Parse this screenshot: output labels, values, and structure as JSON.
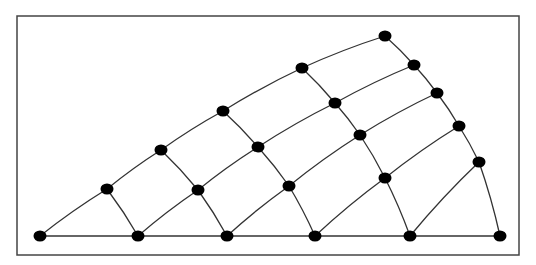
{
  "diagram": {
    "type": "triangular-mesh",
    "colors": {
      "background": "#ffffff",
      "frame": "#444444",
      "edge": "#333333",
      "node": "#000000"
    },
    "frame": {
      "x": 17,
      "y": 16,
      "width": 502,
      "height": 239
    },
    "nodes": [
      {
        "id": "b0",
        "x": 40,
        "y": 236
      },
      {
        "id": "b1",
        "x": 138,
        "y": 236
      },
      {
        "id": "b2",
        "x": 227,
        "y": 236
      },
      {
        "id": "b3",
        "x": 315,
        "y": 236
      },
      {
        "id": "b4",
        "x": 410,
        "y": 236
      },
      {
        "id": "b5",
        "x": 500,
        "y": 236
      },
      {
        "id": "r1a",
        "x": 107,
        "y": 189
      },
      {
        "id": "r1b",
        "x": 198,
        "y": 190
      },
      {
        "id": "r1c",
        "x": 289,
        "y": 186
      },
      {
        "id": "r1d",
        "x": 385,
        "y": 178
      },
      {
        "id": "r1e",
        "x": 479,
        "y": 162
      },
      {
        "id": "r2a",
        "x": 161,
        "y": 150
      },
      {
        "id": "r2b",
        "x": 258,
        "y": 147
      },
      {
        "id": "r2c",
        "x": 360,
        "y": 135
      },
      {
        "id": "r2d",
        "x": 459,
        "y": 126
      },
      {
        "id": "r3a",
        "x": 223,
        "y": 111
      },
      {
        "id": "r3b",
        "x": 335,
        "y": 103
      },
      {
        "id": "r3c",
        "x": 437,
        "y": 93
      },
      {
        "id": "r4a",
        "x": 302,
        "y": 68
      },
      {
        "id": "r4b",
        "x": 414,
        "y": 65
      },
      {
        "id": "t0",
        "x": 385,
        "y": 36
      }
    ],
    "edges": [
      [
        "b0",
        "b1"
      ],
      [
        "b1",
        "b2"
      ],
      [
        "b2",
        "b3"
      ],
      [
        "b3",
        "b4"
      ],
      [
        "b4",
        "b5"
      ],
      [
        "b0",
        "r1a"
      ],
      [
        "r1a",
        "r2a"
      ],
      [
        "r2a",
        "r3a"
      ],
      [
        "r3a",
        "r4a"
      ],
      [
        "r4a",
        "t0"
      ],
      [
        "b5",
        "r1e"
      ],
      [
        "r1e",
        "r2d"
      ],
      [
        "r2d",
        "r3c"
      ],
      [
        "r3c",
        "r4b"
      ],
      [
        "r4b",
        "t0"
      ],
      [
        "b1",
        "r1b"
      ],
      [
        "r1b",
        "r2b"
      ],
      [
        "r2b",
        "r3b"
      ],
      [
        "r3b",
        "r4b"
      ],
      [
        "b2",
        "r1c"
      ],
      [
        "r1c",
        "r2c"
      ],
      [
        "r2c",
        "r3c"
      ],
      [
        "b3",
        "r1d"
      ],
      [
        "r1d",
        "r2d"
      ],
      [
        "b4",
        "r1e"
      ],
      [
        "r1a",
        "b1"
      ],
      [
        "r2a",
        "r1b"
      ],
      [
        "r1b",
        "b2"
      ],
      [
        "r3a",
        "r2b"
      ],
      [
        "r2b",
        "r1c"
      ],
      [
        "r1c",
        "b3"
      ],
      [
        "r4a",
        "r3b"
      ],
      [
        "r3b",
        "r2c"
      ],
      [
        "r2c",
        "r1d"
      ],
      [
        "r1d",
        "b4"
      ]
    ],
    "node_radius_x": 6.5,
    "node_radius_y": 5.5
  }
}
